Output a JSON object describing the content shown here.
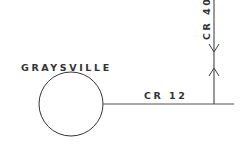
{
  "diagram": {
    "type": "road-map-sketch",
    "town": {
      "name": "GRAYSVILLE",
      "shape": "circle"
    },
    "roads": [
      {
        "label": "CR 12",
        "orientation": "horizontal"
      },
      {
        "label": "CR 40",
        "orientation": "vertical"
      }
    ],
    "colors": {
      "line": "#333333",
      "background": "#ffffff"
    }
  }
}
